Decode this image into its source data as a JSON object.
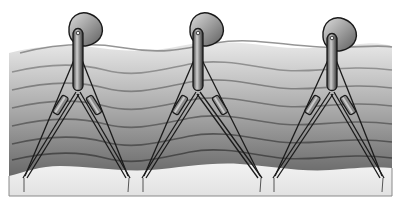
{
  "figure": {
    "colors": {
      "background": "#ffffff",
      "water_top": "#e6e6e6",
      "water_bottom": "#5a5a5a",
      "wave_line": "#8c8c8c",
      "seabed": "#ececec",
      "outline": "#1a1a1a",
      "float_light": "#d8d8d8",
      "float_dark": "#6e6e6e"
    },
    "devices": [
      {
        "id": "device-1",
        "cx": 78,
        "head_cx": 84,
        "head_cy": 30,
        "apex_y": 92,
        "left_foot": [
          23,
          178
        ],
        "right_foot": [
          130,
          178
        ]
      },
      {
        "id": "device-2",
        "cx": 198,
        "head_cx": 205,
        "head_cy": 30,
        "apex_y": 92,
        "left_foot": [
          142,
          178
        ],
        "right_foot": [
          262,
          178
        ]
      },
      {
        "id": "device-3",
        "cx": 332,
        "head_cx": 338,
        "head_cy": 35,
        "apex_y": 92,
        "left_foot": [
          273,
          178
        ],
        "right_foot": [
          384,
          178
        ]
      }
    ]
  }
}
